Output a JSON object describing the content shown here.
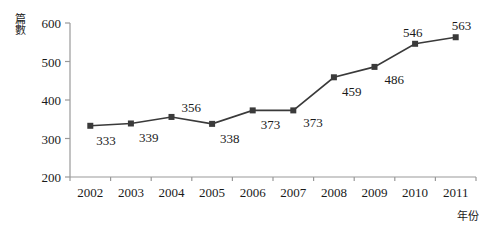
{
  "chart_data": {
    "type": "line",
    "title": "",
    "xlabel": "年份",
    "ylabel": "篇數",
    "categories": [
      "2002",
      "2003",
      "2004",
      "2005",
      "2006",
      "2007",
      "2008",
      "2009",
      "2010",
      "2011"
    ],
    "values": [
      333,
      339,
      356,
      338,
      373,
      373,
      459,
      486,
      546,
      563
    ],
    "series": [
      {
        "name": "篇數",
        "values": [
          333,
          339,
          356,
          338,
          373,
          373,
          459,
          486,
          546,
          563
        ]
      }
    ],
    "ylim": [
      200,
      600
    ],
    "yticks": [
      200,
      300,
      400,
      500,
      600
    ],
    "ytick_labels": [
      "200",
      "300",
      "400",
      "500",
      "600"
    ],
    "grid": false,
    "legend": false,
    "legend_position": "none",
    "marker": "square",
    "line_color": "#3a3a3a",
    "marker_color": "#3a3a3a",
    "axis_color": "#999999",
    "data_labels": [
      "333",
      "339",
      "356",
      "338",
      "373",
      "373",
      "459",
      "486",
      "546",
      "563"
    ]
  },
  "axes": {
    "y_title": "篇數",
    "x_title": "年份"
  }
}
